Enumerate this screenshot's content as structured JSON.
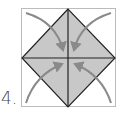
{
  "step": {
    "label": "4."
  },
  "diagram": {
    "paper_outline_style": "dotted",
    "fill_color": "#c8c8c8",
    "line_color": "#222222",
    "arrow_color": "#8a8a8a",
    "arrows": [
      {
        "from": "top-left-corner",
        "to": "center"
      },
      {
        "from": "top-right-corner",
        "to": "center"
      },
      {
        "from": "bottom-left-corner",
        "to": "center"
      },
      {
        "from": "bottom-right-corner",
        "to": "center"
      }
    ]
  }
}
